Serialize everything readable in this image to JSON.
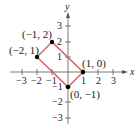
{
  "figure": {
    "axis_labels": {
      "x": "x",
      "y": "y"
    },
    "x_ticks": [
      "−3",
      "−2",
      "−1",
      "1",
      "2",
      "3"
    ],
    "y_ticks": [
      "3",
      "2",
      "1",
      "−1",
      "−2",
      "−3"
    ],
    "points": [
      {
        "label": "(−1, 2)",
        "x": -1,
        "y": 2
      },
      {
        "label": "(−2, 1)",
        "x": -2,
        "y": 1
      },
      {
        "label": "(1, 0)",
        "x": 1,
        "y": 0
      },
      {
        "label": "(0, −1)",
        "x": 0,
        "y": -1
      }
    ],
    "shape": "rectangle",
    "shape_color": "#d9534f",
    "point_color": "#000000"
  }
}
